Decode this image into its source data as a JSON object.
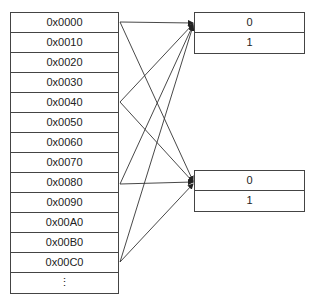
{
  "address_table": {
    "rows": [
      "0x0000",
      "0x0010",
      "0x0020",
      "0x0030",
      "0x0040",
      "0x0050",
      "0x0060",
      "0x0070",
      "0x0080",
      "0x0090",
      "0x00A0",
      "0x00B0",
      "0x00C0"
    ],
    "ellipsis": "⋮"
  },
  "set_boxes": [
    {
      "rows": [
        "0",
        "1"
      ]
    },
    {
      "rows": [
        "0",
        "1"
      ]
    }
  ],
  "mappings": [
    {
      "from": "0x0000",
      "to": [
        "set_0",
        "set_1"
      ]
    },
    {
      "from": "0x0040",
      "to": [
        "set_0",
        "set_1"
      ]
    },
    {
      "from": "0x0080",
      "to": [
        "set_0",
        "set_1"
      ]
    },
    {
      "from": "0x00C0",
      "to": [
        "set_0",
        "set_1"
      ]
    }
  ],
  "colors": {
    "line": "#333333",
    "border": "#444444"
  }
}
